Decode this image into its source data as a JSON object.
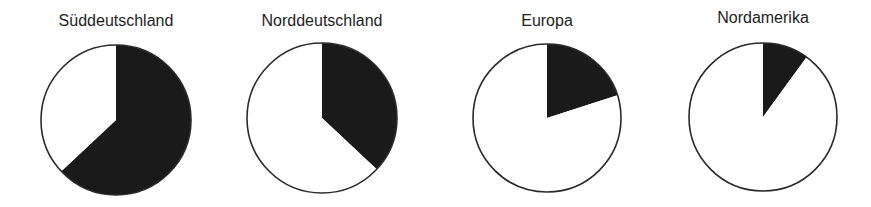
{
  "chart_data": [
    {
      "type": "pie",
      "title": "Süddeutschland",
      "labels": [
        "dunkel",
        "hell"
      ],
      "values": [
        63,
        37
      ],
      "colors": [
        "#1a1a1a",
        "#ffffff"
      ],
      "start_angle_deg": 0,
      "direction": "clockwise",
      "center": [
        116,
        120
      ],
      "radius": 75,
      "title_top": 12,
      "block_left": 16
    },
    {
      "type": "pie",
      "title": "Norddeutschland",
      "labels": [
        "dunkel",
        "hell"
      ],
      "values": [
        37,
        63
      ],
      "colors": [
        "#1a1a1a",
        "#ffffff"
      ],
      "start_angle_deg": 0,
      "direction": "clockwise",
      "center": [
        322,
        118
      ],
      "radius": 75,
      "title_top": 12,
      "block_left": 222
    },
    {
      "type": "pie",
      "title": "Europa",
      "labels": [
        "dunkel",
        "hell"
      ],
      "values": [
        20,
        80
      ],
      "colors": [
        "#1a1a1a",
        "#ffffff"
      ],
      "start_angle_deg": 0,
      "direction": "clockwise",
      "center": [
        547,
        118
      ],
      "radius": 74,
      "title_top": 12,
      "block_left": 443
    },
    {
      "type": "pie",
      "title": "Nordamerika",
      "labels": [
        "dunkel",
        "hell"
      ],
      "values": [
        10,
        90
      ],
      "colors": [
        "#1a1a1a",
        "#ffffff"
      ],
      "start_angle_deg": 0,
      "direction": "clockwise",
      "center": [
        763,
        117
      ],
      "radius": 74,
      "title_top": 9,
      "block_left": 663
    }
  ]
}
